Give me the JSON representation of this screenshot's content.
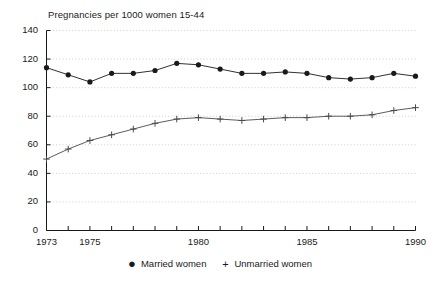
{
  "chart_data": {
    "type": "line",
    "title": "Pregnancies per 1000 women 15-44",
    "xlabel": "",
    "ylabel": "",
    "xlim": [
      1973,
      1990
    ],
    "ylim": [
      0,
      140
    ],
    "ytick_step": 20,
    "yticks": [
      0,
      20,
      40,
      60,
      80,
      100,
      120,
      140
    ],
    "ytick_labels": [
      "0",
      "20",
      "40",
      "60",
      "80",
      "100",
      "120",
      "140"
    ],
    "x": [
      1973,
      1974,
      1975,
      1976,
      1977,
      1978,
      1979,
      1980,
      1981,
      1982,
      1983,
      1984,
      1985,
      1986,
      1987,
      1988,
      1989,
      1990
    ],
    "xticks": [
      1973,
      1974,
      1975,
      1976,
      1977,
      1978,
      1979,
      1980,
      1981,
      1982,
      1983,
      1984,
      1985,
      1986,
      1987,
      1988,
      1989,
      1990
    ],
    "xtick_labels_shown": [
      {
        "value": 1973,
        "label": "1973"
      },
      {
        "value": 1975,
        "label": "1975"
      },
      {
        "value": 1980,
        "label": "1980"
      },
      {
        "value": 1985,
        "label": "1985"
      },
      {
        "value": 1990,
        "label": "1990"
      }
    ],
    "grid": true,
    "grid_style": "dotted-horizontal",
    "legend_position": "bottom-center",
    "series": [
      {
        "name": "Married women",
        "marker": "filled-circle",
        "color": "#1a1a1a",
        "values": [
          114,
          109,
          104,
          110,
          110,
          112,
          117,
          116,
          113,
          110,
          110,
          111,
          110,
          107,
          106,
          107,
          110,
          108
        ]
      },
      {
        "name": "Unmarried women",
        "marker": "plus",
        "color": "#4a4a4a",
        "values": [
          50,
          57,
          63,
          67,
          71,
          75,
          78,
          79,
          78,
          77,
          78,
          79,
          79,
          80,
          80,
          81,
          84,
          86
        ]
      }
    ]
  },
  "legend": {
    "entries": [
      {
        "marker_glyph": "●",
        "label": "Married women"
      },
      {
        "marker_glyph": "+",
        "label": "Unmarried women"
      }
    ]
  }
}
